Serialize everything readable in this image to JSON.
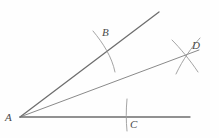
{
  "figure": {
    "type": "geometry-construction",
    "background_color": "#fefefe",
    "stroke_color": "#6e6e6e",
    "label_color": "#4a4a4a",
    "width": 219,
    "height": 138
  },
  "points": [
    {
      "id": "A",
      "label": "A",
      "x": 20,
      "y": 117,
      "label_x": 5,
      "label_y": 112
    },
    {
      "id": "B",
      "label": "B",
      "x": 105,
      "y": 49,
      "label_x": 102,
      "label_y": 27
    },
    {
      "id": "C",
      "label": "C",
      "x": 127,
      "y": 117,
      "label_x": 130,
      "label_y": 119
    },
    {
      "id": "D",
      "label": "D",
      "x": 188,
      "y": 57,
      "label_x": 192,
      "label_y": 40
    }
  ],
  "rays": [
    {
      "id": "upper-ray",
      "from": "A",
      "x1": 20,
      "y1": 117,
      "x2": 159,
      "y2": 12,
      "width": 1.3
    },
    {
      "id": "bisector-ray",
      "from": "A",
      "x1": 20,
      "y1": 117,
      "x2": 199,
      "y2": 50,
      "width": 1.0
    },
    {
      "id": "lower-ray",
      "from": "A",
      "x1": 20,
      "y1": 117,
      "x2": 190,
      "y2": 117,
      "width": 1.3
    }
  ],
  "arcs": [
    {
      "id": "arc-at-B",
      "path": "M 93,31 C 103,43 112,57 115,72",
      "width": 0.9
    },
    {
      "id": "arc-at-C",
      "path": "M 127,99 C 126,110 126,121 127,131",
      "width": 0.9
    },
    {
      "id": "arc-at-D-from-B",
      "path": "M 172,40 C 180,48 190,60 198,72",
      "width": 0.9
    },
    {
      "id": "arc-at-D-from-C",
      "path": "M 200,38 C 192,47 183,59 176,74",
      "width": 0.9
    }
  ]
}
